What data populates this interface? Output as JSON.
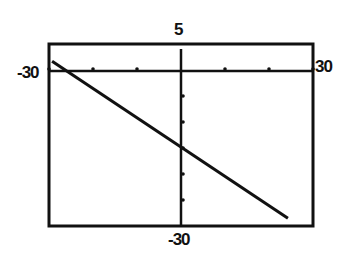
{
  "chart_data": {
    "type": "line",
    "title": "",
    "xlabel": "",
    "ylabel": "",
    "xlim": [
      -30,
      30
    ],
    "ylim": [
      -30,
      5
    ],
    "grid": false,
    "x_ticks_count_each_side": 3,
    "y_ticks_count_below": 5,
    "series": [
      {
        "name": "line",
        "x": [
          -29.3,
          24.3
        ],
        "y": [
          1.7,
          -28.5
        ],
        "approx_equation": "y = -0.56x - 15"
      }
    ],
    "window_labels": {
      "ymax": "5",
      "ymin": "-30",
      "xmin": "-30",
      "xmax": "30"
    }
  },
  "colors": {
    "ink": "#111111",
    "background": "#ffffff"
  }
}
